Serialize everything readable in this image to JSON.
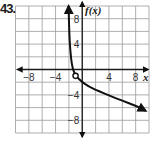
{
  "problem": {
    "number": "43."
  },
  "chart_data": {
    "type": "line",
    "title": "",
    "xlabel": "x",
    "ylabel": "f(x)",
    "xlim": [
      -10,
      10
    ],
    "ylim": [
      -10,
      10
    ],
    "grid": true,
    "grid_step": 2,
    "x_ticks": [
      {
        "value": -8,
        "label": "−8"
      },
      {
        "value": -4,
        "label": "−4"
      },
      {
        "value": 4,
        "label": "4"
      },
      {
        "value": 8,
        "label": "8"
      }
    ],
    "y_ticks": [
      {
        "value": 8,
        "label": "8"
      },
      {
        "value": 4,
        "label": "4"
      },
      {
        "value": -4,
        "label": "−4"
      },
      {
        "value": -8,
        "label": "−8"
      }
    ],
    "series": [
      {
        "name": "f(x)",
        "points": [
          [
            -2.05,
            10
          ],
          [
            -1.95,
            6
          ],
          [
            -1.8,
            3
          ],
          [
            -1.5,
            0.3
          ],
          [
            -1,
            -1
          ],
          [
            0,
            -2
          ],
          [
            1,
            -2.7
          ],
          [
            2,
            -3.2
          ],
          [
            4,
            -4.1
          ],
          [
            6,
            -4.9
          ],
          [
            8,
            -5.7
          ],
          [
            9.5,
            -6.5
          ]
        ],
        "arrow_start": true,
        "arrow_end": true,
        "color": "#111111"
      }
    ],
    "annotations": [
      {
        "type": "open-circle",
        "x": -1,
        "y": -1,
        "label": "O"
      }
    ]
  },
  "colors": {
    "grid": "#9a9a9a",
    "axis": "#1a1a1a",
    "curve": "#111111"
  }
}
